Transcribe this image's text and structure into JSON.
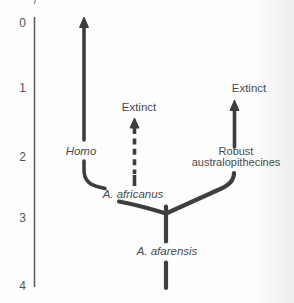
{
  "figure": {
    "type": "phylogenetic-tree",
    "colors": {
      "line": "#3e3e3e",
      "text": "#4a4a4a",
      "axis": "#5a5a5a",
      "background": "#fdfdfd",
      "scan_edge_shade": "#ededed"
    }
  },
  "axis": {
    "orientation": "vertical",
    "ticks": [
      {
        "label": "0"
      },
      {
        "label": "1"
      },
      {
        "label": "2"
      },
      {
        "label": "3"
      },
      {
        "label": "4"
      }
    ]
  },
  "labels": {
    "homo": "Homo",
    "extinct_middle": "Extinct",
    "extinct_right": "Extinct",
    "robust_line1": "Robust",
    "robust_line2": "australopithecines",
    "a_africanus": "A. africanus",
    "a_afarensis": "A. afarensis"
  },
  "tree": {
    "root_label": "A. afarensis",
    "branch_point_time": "about 2.9 on axis",
    "branches": [
      {
        "label": "A. africanus",
        "descendants": [
          {
            "label": "Homo",
            "line_style": "solid",
            "tip": "arrow reaching 0"
          },
          {
            "label": "Extinct",
            "line_style": "dashed",
            "tip": "arrow ending about 1.5"
          }
        ]
      },
      {
        "label": "Robust australopithecines",
        "descendants": [
          {
            "label": "Extinct",
            "line_style": "solid",
            "tip": "arrow ending about 1.2"
          }
        ]
      }
    ]
  }
}
